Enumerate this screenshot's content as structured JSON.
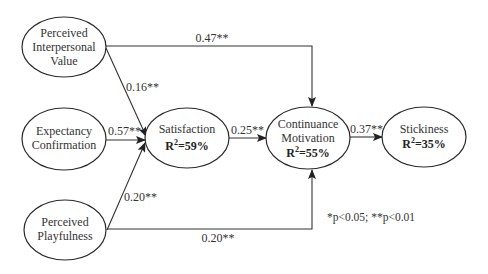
{
  "diagram": {
    "nodes": [
      {
        "id": "piv",
        "lines": [
          "Perceived",
          "Interpersonal",
          "Value"
        ],
        "r2": null
      },
      {
        "id": "ec",
        "lines": [
          "Expectancy",
          "Confirmation"
        ],
        "r2": null
      },
      {
        "id": "pp",
        "lines": [
          "Perceived",
          "Playfulness"
        ],
        "r2": null
      },
      {
        "id": "sat",
        "lines": [
          "Satisfaction"
        ],
        "r2": "=59%"
      },
      {
        "id": "cm",
        "lines": [
          "Continuance",
          "Motivation"
        ],
        "r2": "=55%"
      },
      {
        "id": "stk",
        "lines": [
          "Stickiness"
        ],
        "r2": "=35%"
      }
    ],
    "r_label": "R",
    "r_sup": "2",
    "edges": [
      {
        "from": "Perceived Interpersonal Value",
        "to": "Continuance Motivation",
        "label": "0.47**"
      },
      {
        "from": "Perceived Interpersonal Value",
        "to": "Satisfaction",
        "label": "0.16**"
      },
      {
        "from": "Expectancy Confirmation",
        "to": "Satisfaction",
        "label": "0.57**"
      },
      {
        "from": "Perceived Playfulness",
        "to": "Satisfaction",
        "label": "0.20**"
      },
      {
        "from": "Satisfaction",
        "to": "Continuance Motivation",
        "label": "0.25**"
      },
      {
        "from": "Continuance Motivation",
        "to": "Stickiness",
        "label": "0.37**"
      },
      {
        "from": "Perceived Playfulness",
        "to": "Continuance Motivation",
        "label": "0.20**"
      }
    ],
    "note": "*p<0.05; **p<0.01"
  }
}
